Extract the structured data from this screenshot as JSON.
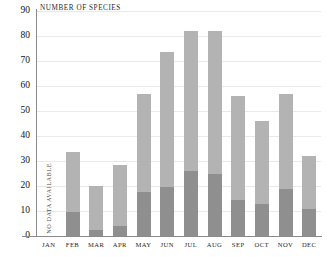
{
  "chart_data": {
    "type": "bar",
    "title": "Number of Species",
    "subtitle": "",
    "xlabel": "",
    "ylabel": "Number of species",
    "ylim": [
      0,
      90
    ],
    "ytick_values": [
      0,
      10,
      20,
      30,
      40,
      50,
      60,
      70,
      80,
      90
    ],
    "grid": true,
    "legend": "none",
    "stacked": true,
    "categories": [
      "Jan",
      "Feb",
      "Mar",
      "Apr",
      "May",
      "Jun",
      "Jul",
      "Aug",
      "Sep",
      "Oct",
      "Nov",
      "Dec"
    ],
    "category_labels": [
      "JAN",
      "FEB",
      "MAR",
      "APR",
      "MAY",
      "JUN",
      "JUL",
      "AUG",
      "SEP",
      "OCT",
      "NOV",
      "DEC"
    ],
    "series": [
      {
        "name": "Lower segment",
        "color": "#8f8f8f",
        "values": [
          0,
          9.5,
          2.5,
          4,
          17.5,
          19.5,
          26,
          25,
          14.5,
          13,
          19,
          11
        ]
      },
      {
        "name": "Upper segment",
        "color": "#b3b3b3",
        "values": [
          0,
          24,
          17.5,
          24.5,
          39.5,
          54,
          56,
          57,
          41.5,
          33,
          38,
          21
        ]
      }
    ],
    "totals": [
      0,
      33.5,
      20,
      28.5,
      57,
      73.5,
      82,
      82,
      56,
      46,
      57,
      32
    ],
    "annotations": [
      {
        "category": "Jan",
        "text": "No data available",
        "orientation": "vertical"
      }
    ]
  },
  "colors": {
    "bar_dark": "#8f8f8f",
    "bar_light": "#b3b3b3",
    "gridline": "#e9e9e9",
    "axis": "#8a8a8a",
    "text": "#1a1a1a",
    "background": "#ffffff"
  }
}
